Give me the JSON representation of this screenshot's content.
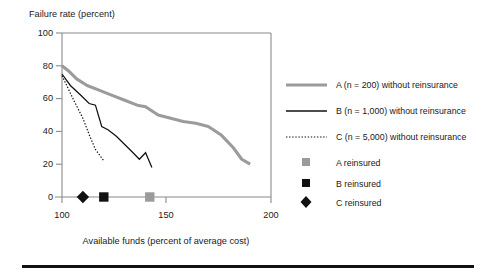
{
  "chart_data": {
    "type": "line",
    "title": "",
    "ylabel": "Failure rate (percent)",
    "xlabel": "Available funds (percent of average cost)",
    "xlim": [
      100,
      200
    ],
    "ylim": [
      0,
      100
    ],
    "xticks": [
      100,
      150,
      200
    ],
    "yticks": [
      0,
      20,
      40,
      60,
      80,
      100
    ],
    "grid": false,
    "legend_position": "right",
    "series": [
      {
        "name": "A (n = 200) without reinsurance",
        "style": "thick-gray-line",
        "color": "#9b9b9b",
        "x": [
          100,
          103,
          107,
          112,
          118,
          124,
          130,
          136,
          140,
          146,
          152,
          158,
          164,
          170,
          176,
          182,
          186,
          190
        ],
        "y": [
          80,
          77,
          72,
          68,
          65,
          62,
          59,
          56,
          55,
          50,
          48,
          46,
          45,
          43,
          38,
          30,
          23,
          20
        ]
      },
      {
        "name": "B (n = 1,000) without reinsurance",
        "style": "thin-black-line",
        "color": "#111111",
        "x": [
          100,
          104,
          109,
          113,
          116,
          119,
          122,
          126,
          130,
          134,
          137,
          140,
          143
        ],
        "y": [
          75,
          68,
          62,
          57,
          56,
          43,
          41,
          37,
          32,
          27,
          23,
          27,
          18
        ]
      },
      {
        "name": "C (n = 5,000) without reinsurance",
        "style": "dotted-black-line",
        "color": "#111111",
        "x": [
          100,
          103,
          106,
          110,
          113,
          116,
          120
        ],
        "y": [
          74,
          66,
          58,
          48,
          38,
          29,
          22
        ]
      }
    ],
    "point_markers": [
      {
        "name": "A reinsured",
        "shape": "square",
        "color": "#9b9b9b",
        "x": 142,
        "y": 0
      },
      {
        "name": "B reinsured",
        "shape": "square",
        "color": "#111111",
        "x": 120,
        "y": 0
      },
      {
        "name": "C reinsured",
        "shape": "diamond",
        "color": "#111111",
        "x": 110,
        "y": 0
      }
    ]
  },
  "axes": {
    "y_title": "Failure rate (percent)",
    "x_title": "Available funds (percent of average cost)",
    "y_ticks": [
      "100",
      "80",
      "60",
      "40",
      "20",
      "0"
    ],
    "x_ticks": [
      "100",
      "150",
      "200"
    ]
  },
  "legend": {
    "entries": [
      {
        "label": "A (n = 200) without reinsurance",
        "swatch": "line-gray-thick"
      },
      {
        "label": "B (n = 1,000) without reinsurance",
        "swatch": "line-black-thin"
      },
      {
        "label": "C (n = 5,000) without reinsurance",
        "swatch": "line-black-dotted"
      },
      {
        "label": "A reinsured",
        "swatch": "square-gray"
      },
      {
        "label": "B reinsured",
        "swatch": "square-black"
      },
      {
        "label": "C reinsured",
        "swatch": "diamond-black"
      }
    ]
  },
  "colors": {
    "series_a": "#9b9b9b",
    "series_b": "#111111",
    "series_c": "#111111",
    "axis": "#8a8a8a",
    "text": "#1a1a1a",
    "rule": "#111111"
  }
}
